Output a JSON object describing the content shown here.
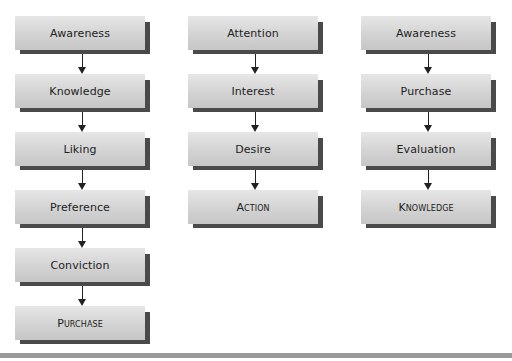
{
  "diagram": {
    "type": "hierarchy-of-effects-models",
    "columns": [
      {
        "name": "hierarchy-of-effects",
        "stages": [
          {
            "label": "Awareness",
            "caps": false
          },
          {
            "label": "Knowledge",
            "caps": false
          },
          {
            "label": "Liking",
            "caps": false
          },
          {
            "label": "Preference",
            "caps": false
          },
          {
            "label": "Conviction",
            "caps": false
          },
          {
            "label": "Purchase",
            "caps": true
          }
        ]
      },
      {
        "name": "aida",
        "stages": [
          {
            "label": "Attention",
            "caps": false
          },
          {
            "label": "Interest",
            "caps": false
          },
          {
            "label": "Desire",
            "caps": false
          },
          {
            "label": "Action",
            "caps": true
          }
        ]
      },
      {
        "name": "alternative-sequence",
        "stages": [
          {
            "label": "Awareness",
            "caps": false
          },
          {
            "label": "Purchase",
            "caps": false
          },
          {
            "label": "Evaluation",
            "caps": false
          },
          {
            "label": "Knowledge",
            "caps": true
          }
        ]
      }
    ],
    "colors": {
      "box_top": "#e6e6e6",
      "box_bottom": "#c6c6c6",
      "shadow": "#4a4a4a",
      "arrow": "#222222",
      "bottom_bar": "#9a9a9a"
    }
  }
}
